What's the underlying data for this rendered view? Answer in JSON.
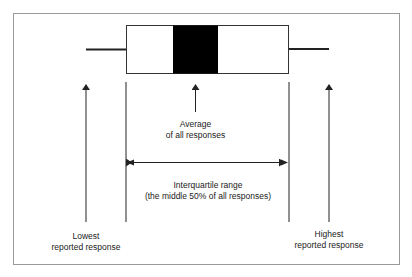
{
  "diagram": {
    "type": "box-plot-explainer",
    "labels": {
      "average_line1": "Average",
      "average_line2": "of all responses",
      "iqr_line1": "Interquartile range",
      "iqr_line2": "(the middle 50% of all responses)",
      "lowest_line1": "Lowest",
      "lowest_line2": "reported response",
      "highest_line1": "Highest",
      "highest_line2": "reported response"
    },
    "colors": {
      "stroke": "#222222",
      "fill_average": "#000000",
      "frame": "#9a9a9a"
    }
  }
}
